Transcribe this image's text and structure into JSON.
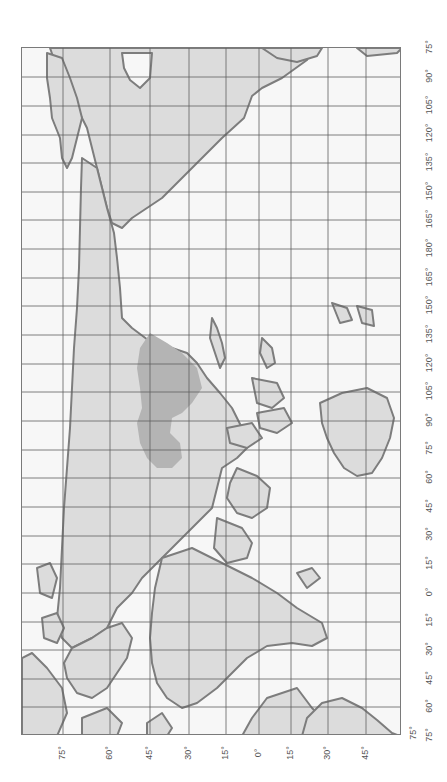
{
  "map": {
    "title": "World map with highlighted country",
    "orientation": "rotated 90 degrees clockwise",
    "highlighted_region": "China",
    "colors": {
      "background": "#ffffff",
      "ocean": "#f7f7f7",
      "land": "#dcdcdc",
      "coastline": "#7d7d7d",
      "highlight": "#b4b4b4",
      "grid": "#5f5f5f",
      "label": "#555555"
    },
    "longitude_labels": [
      "75°",
      "90°",
      "105°",
      "120°",
      "135°",
      "150°",
      "165°",
      "180°",
      "165°",
      "150°",
      "135°",
      "120°",
      "105°",
      "90°",
      "75°",
      "60°",
      "45°",
      "30°",
      "15°",
      "0°",
      "15°",
      "30°",
      "45°",
      "60°",
      "75°"
    ],
    "latitude_labels": [
      "75°",
      "60°",
      "45°",
      "30°",
      "15°",
      "0°",
      "15°",
      "30°",
      "45°",
      "75°"
    ]
  }
}
